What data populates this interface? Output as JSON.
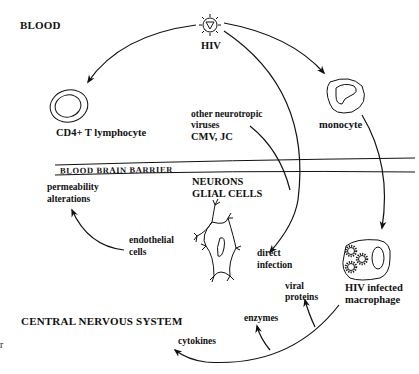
{
  "diagram": {
    "regions": {
      "blood": "BLOOD",
      "cns": "CENTRAL NERVOUS SYSTEM",
      "barrier": "BLOOD BRAIN BARRIER"
    },
    "nodes": {
      "hiv": "HIV",
      "cd4": "CD4+ T lymphocyte",
      "monocyte": "monocyte",
      "other_viruses_l1": "other neurotropic",
      "other_viruses_l2": "viruses",
      "other_viruses_l3": "CMV, JC",
      "neurons": "NEURONS",
      "glial": "GLIAL CELLS",
      "permeability_l1": "permeability",
      "permeability_l2": "alterations",
      "endothelial_l1": "endothelial",
      "endothelial_l2": "cells",
      "direct_l1": "direct",
      "direct_l2": "infection",
      "macrophage_l1": "HIV infected",
      "macrophage_l2": "macrophage",
      "viral_l1": "viral",
      "viral_l2": "proteins",
      "enzymes": "enzymes",
      "cytokines": "cytokines",
      "stray_mark": "r"
    },
    "edges": [
      {
        "from": "HIV",
        "to": "CD4+ T lymphocyte"
      },
      {
        "from": "HIV",
        "to": "monocyte"
      },
      {
        "from": "HIV",
        "to": "direct infection"
      },
      {
        "from": "other neurotropic viruses CMV, JC",
        "to": "direct infection"
      },
      {
        "from": "monocyte",
        "to": "HIV infected macrophage"
      },
      {
        "from": "endothelial cells",
        "to": "permeability alterations"
      },
      {
        "from": "HIV infected macrophage",
        "to": "viral proteins"
      },
      {
        "from": "HIV infected macrophage",
        "to": "enzymes"
      },
      {
        "from": "HIV infected macrophage",
        "to": "cytokines"
      }
    ],
    "colors": {
      "ink": "#111111",
      "background": "#ffffff"
    }
  }
}
